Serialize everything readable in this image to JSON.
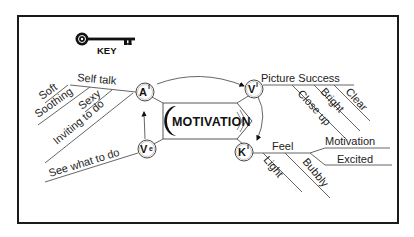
{
  "key": {
    "label": "KEY",
    "icon": "key-icon"
  },
  "center": {
    "label": "MOTIVATION"
  },
  "nodes": {
    "ai": {
      "letter": "A",
      "sup": "i"
    },
    "vi": {
      "letter": "V",
      "sup": "i"
    },
    "ki": {
      "letter": "K",
      "sup": "i"
    },
    "ve": {
      "letter": "V",
      "sup": "e"
    }
  },
  "branches": {
    "ai": {
      "main": "Self talk",
      "subs": [
        "Soft",
        "Soothing",
        "Sexy",
        "Inviting to do"
      ]
    },
    "ve": {
      "main": "See what to do"
    },
    "vi": {
      "main": "Picture  Success",
      "subs": [
        "Close up",
        "Bright",
        "Clear"
      ]
    },
    "ki": {
      "main": "Feel",
      "subs": [
        "Light",
        "Bubbly"
      ],
      "right": [
        "Motivation",
        "Excited"
      ]
    }
  },
  "colors": {
    "ink": "#111111",
    "line": "#555555",
    "border": "#1a1a1a",
    "background": "#ffffff"
  }
}
